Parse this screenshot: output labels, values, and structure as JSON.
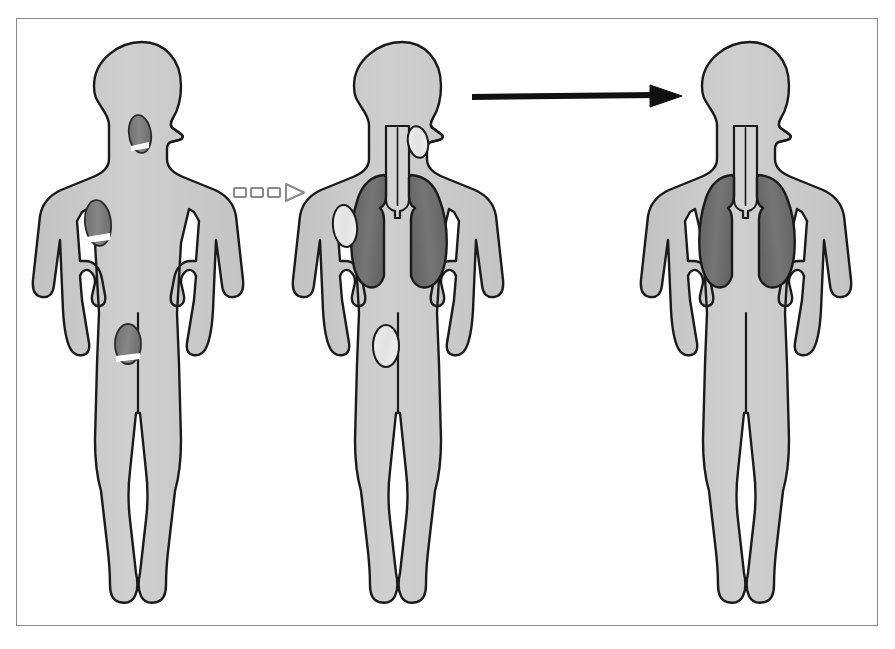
{
  "diagram": {
    "domain": "medical-illustration",
    "frame": {
      "border_color": "#8a8a8a",
      "background": "#ffffff"
    },
    "palette": {
      "body_fill": "#c9c9c9",
      "body_fill_light": "#d8d8d8",
      "outline": "#1a1a1a",
      "lesion_active": "#7d7d7d",
      "lesion_active_dark": "#6a6a6a",
      "lesion_highlight": "#ffffff",
      "lesion_resolved": "#e6e6e6",
      "lung_fill": "#6e6e6e",
      "lung_fill_dark": "#5a5a5a",
      "trachea_fill": "#d0d0d0",
      "arrow_solid": "#111111",
      "arrow_open_stroke": "#8a8a8a"
    },
    "figures": [
      {
        "id": "figure-1",
        "order": 1,
        "label": "Baseline",
        "state": "active-disease",
        "has_lungs": false,
        "has_trachea": false,
        "lesions": [
          {
            "site": "neck",
            "appearance": "dark-oval-with-white-band",
            "status": "active"
          },
          {
            "site": "axilla",
            "appearance": "dark-oval-with-white-band",
            "status": "active"
          },
          {
            "site": "groin",
            "appearance": "dark-oval-with-white-band",
            "status": "active"
          }
        ]
      },
      {
        "id": "figure-2",
        "order": 2,
        "label": "Partial response",
        "state": "partial-response",
        "has_lungs": true,
        "has_trachea": true,
        "lesions": [
          {
            "site": "neck",
            "appearance": "pale-outlined-oval",
            "status": "resolving"
          },
          {
            "site": "axilla",
            "appearance": "pale-outlined-oval",
            "status": "resolving"
          },
          {
            "site": "groin",
            "appearance": "pale-outlined-oval",
            "status": "resolving"
          }
        ]
      },
      {
        "id": "figure-3",
        "order": 3,
        "label": "Complete resolution",
        "state": "resolved",
        "has_lungs": true,
        "has_trachea": true,
        "lesions": []
      }
    ],
    "connectors": [
      {
        "id": "connector-dashed",
        "style": "dashed-open-arrow",
        "from": "figure-1",
        "to": "figure-2",
        "direction": "right",
        "dash_count": 3,
        "filled": false
      },
      {
        "id": "connector-solid",
        "style": "solid-arrow",
        "from": "figure-2",
        "to": "figure-3",
        "direction": "right",
        "filled": true
      }
    ]
  }
}
